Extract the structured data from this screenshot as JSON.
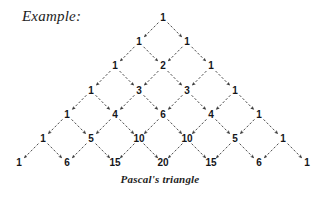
{
  "page": {
    "background_color": "#ffffff",
    "width": 320,
    "height": 198
  },
  "example_label": "Example:",
  "caption": "Pascal's triangle",
  "figure": {
    "name": "pascals-triangle",
    "ink_color": "#15161a",
    "arrow_color": "#3a3a3a",
    "arrow_style": "dashed-with-arrowhead",
    "apex_x": 163,
    "apex_y": 18,
    "row_gap_y": 24.2,
    "half_gap_x": 24.0,
    "rows": [
      [
        1
      ],
      [
        1,
        1
      ],
      [
        1,
        2,
        1
      ],
      [
        1,
        3,
        3,
        1
      ],
      [
        1,
        4,
        6,
        4,
        1
      ],
      [
        1,
        5,
        10,
        10,
        5,
        1
      ],
      [
        1,
        6,
        15,
        20,
        15,
        6,
        1
      ]
    ]
  },
  "chart_data": {
    "type": "diagram",
    "title": "Pascal's triangle",
    "rows": [
      {
        "row": 0,
        "values": [
          1
        ]
      },
      {
        "row": 1,
        "values": [
          1,
          1
        ]
      },
      {
        "row": 2,
        "values": [
          1,
          2,
          1
        ]
      },
      {
        "row": 3,
        "values": [
          1,
          3,
          3,
          1
        ]
      },
      {
        "row": 4,
        "values": [
          1,
          4,
          6,
          4,
          1
        ]
      },
      {
        "row": 5,
        "values": [
          1,
          5,
          10,
          10,
          5,
          1
        ]
      },
      {
        "row": 6,
        "values": [
          1,
          6,
          15,
          20,
          15,
          6,
          1
        ]
      }
    ],
    "edges": "each value at (r,k) has arrows to (r+1,k) and (r+1,k+1)",
    "xlabel": "",
    "ylabel": "",
    "grid": false,
    "legend": false
  }
}
